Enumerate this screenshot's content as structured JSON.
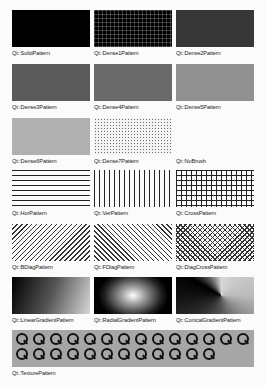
{
  "patterns": [
    {
      "label": "Qt::SolidPattern",
      "style": "solid"
    },
    {
      "label": "Qt::Dense1Pattern",
      "style": "dense1"
    },
    {
      "label": "Qt::Dense2Pattern",
      "style": "dense2"
    },
    {
      "label": "Qt::Dense3Pattern",
      "style": "dense3"
    },
    {
      "label": "Qt::Dense4Pattern",
      "style": "dense4"
    },
    {
      "label": "Qt::Dense5Pattern",
      "style": "dense5"
    },
    {
      "label": "Qt::Dense6Pattern",
      "style": "dense6"
    },
    {
      "label": "Qt::Dense7Pattern",
      "style": "dense7"
    },
    {
      "label": "Qt::NoBrush",
      "style": "nobrush"
    },
    {
      "label": "Qt::HorPattern",
      "style": "hor"
    },
    {
      "label": "Qt::VerPattern",
      "style": "ver"
    },
    {
      "label": "Qt::CrossPattern",
      "style": "cross"
    },
    {
      "label": "Qt::BDiagPattern",
      "style": "bdiag"
    },
    {
      "label": "Qt::FDiagPattern",
      "style": "fdiag"
    },
    {
      "label": "Qt::DiagCrossPattern",
      "style": "diagcross"
    },
    {
      "label": "Qt::LinearGradientPattern",
      "style": "linear"
    },
    {
      "label": "Qt::RadialGradientPattern",
      "style": "radial"
    },
    {
      "label": "Qt::ConicalGradientPattern",
      "style": "conical"
    }
  ],
  "texture": {
    "label": "Qt::TexturePattern",
    "icon": "qt-logo-icon",
    "icon_count": 26
  }
}
